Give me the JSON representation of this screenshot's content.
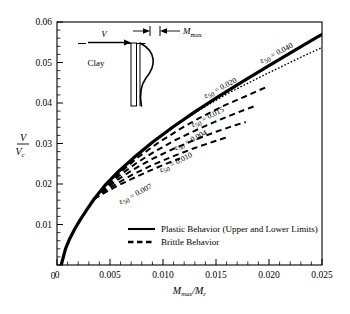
{
  "figure": {
    "background": "#ffffff",
    "plot_frame_color": "#000000"
  },
  "axes": {
    "x": {
      "title_main": "M",
      "title_sub": "max",
      "title_den": "M",
      "title_den_sub": "c",
      "title_full": "Mmax/Mc",
      "min": 0,
      "max": 0.025,
      "major_step": 0.005,
      "minor_step": 0.001,
      "tick_labels": [
        "0",
        "0.005",
        "0.010",
        "0.015",
        "0.020",
        "0.025"
      ],
      "tick_values": [
        0,
        0.005,
        0.01,
        0.015,
        0.02,
        0.025
      ]
    },
    "y": {
      "title_num": "V",
      "title_den": "V",
      "title_den_sub": "c",
      "title_full": "V/Vc",
      "min": 0,
      "max": 0.06,
      "major_step": 0.01,
      "minor_step": 0.002,
      "tick_labels": [
        "0",
        "0.01",
        "0.02",
        "0.03",
        "0.04",
        "0.05",
        "0.06"
      ],
      "tick_values": [
        0,
        0.01,
        0.02,
        0.03,
        0.04,
        0.05,
        0.06
      ]
    }
  },
  "legend": {
    "items": [
      {
        "label": "Plastic Behavior (Upper and Lower Limits)",
        "style": "solid"
      },
      {
        "label": "Brittle Behavior",
        "style": "dashed"
      }
    ]
  },
  "inset": {
    "load_label": "V",
    "soil_label": "Clay",
    "moment_label_main": "M",
    "moment_label_sub": "max"
  },
  "chart_data": {
    "type": "line",
    "title": "",
    "xlabel": "Mmax/Mc",
    "ylabel": "V/Vc",
    "xlim": [
      0,
      0.025
    ],
    "ylim": [
      0,
      0.06
    ],
    "grid": false,
    "legend_position": "bottom-center",
    "series": [
      {
        "name": "Plastic Behavior (Upper and Lower Limits)",
        "style": "solid",
        "width": 3.2,
        "label": "",
        "points": [
          [
            0.0004,
            0.0
          ],
          [
            0.0008,
            0.004
          ],
          [
            0.0012,
            0.0065
          ],
          [
            0.0017,
            0.009
          ],
          [
            0.0022,
            0.0112
          ],
          [
            0.0028,
            0.0136
          ],
          [
            0.0035,
            0.0163
          ],
          [
            0.0045,
            0.0196
          ],
          [
            0.0058,
            0.0231
          ],
          [
            0.0072,
            0.0264
          ],
          [
            0.009,
            0.0303
          ],
          [
            0.011,
            0.0342
          ],
          [
            0.013,
            0.0378
          ],
          [
            0.015,
            0.0412
          ],
          [
            0.0175,
            0.0453
          ],
          [
            0.02,
            0.0492
          ],
          [
            0.0225,
            0.0531
          ],
          [
            0.0245,
            0.0562
          ],
          [
            0.0252,
            0.0572
          ]
        ]
      },
      {
        "name": "eps50 = 0.040",
        "style": "dotted",
        "width": 1.4,
        "label": "ε50 = 0.040",
        "label_value": 0.04,
        "label_x": 0.0193,
        "label_y": 0.0498,
        "label_rotation": -27,
        "points": [
          [
            0.0035,
            0.0163
          ],
          [
            0.0048,
            0.02
          ],
          [
            0.0062,
            0.0238
          ],
          [
            0.008,
            0.0281
          ],
          [
            0.01,
            0.0322
          ],
          [
            0.012,
            0.0359
          ],
          [
            0.0142,
            0.0395
          ],
          [
            0.0165,
            0.0429
          ],
          [
            0.019,
            0.0462
          ],
          [
            0.0215,
            0.0494
          ],
          [
            0.0235,
            0.0519
          ],
          [
            0.025,
            0.0537
          ]
        ]
      },
      {
        "name": "eps50 = 0.020",
        "style": "dashed",
        "width": 2.0,
        "label": "ε50 = 0.020",
        "label_value": 0.02,
        "label_x": 0.014,
        "label_y": 0.0412,
        "label_rotation": -27,
        "points": [
          [
            0.0035,
            0.0163
          ],
          [
            0.0047,
            0.0196
          ],
          [
            0.006,
            0.0229
          ],
          [
            0.0076,
            0.0265
          ],
          [
            0.0095,
            0.0301
          ],
          [
            0.0115,
            0.0334
          ],
          [
            0.0135,
            0.0364
          ],
          [
            0.0158,
            0.0394
          ],
          [
            0.018,
            0.0419
          ],
          [
            0.0198,
            0.044
          ]
        ]
      },
      {
        "name": "eps50 = 0.015",
        "style": "dashed",
        "width": 2.0,
        "label": "ε50 = 0.015",
        "label_value": 0.015,
        "label_x": 0.0128,
        "label_y": 0.034,
        "label_rotation": -27,
        "points": [
          [
            0.0035,
            0.0163
          ],
          [
            0.0046,
            0.0191
          ],
          [
            0.0058,
            0.0219
          ],
          [
            0.0074,
            0.025
          ],
          [
            0.0092,
            0.028
          ],
          [
            0.0112,
            0.0309
          ],
          [
            0.0132,
            0.0334
          ],
          [
            0.0152,
            0.0357
          ],
          [
            0.0172,
            0.0378
          ],
          [
            0.0186,
            0.0392
          ]
        ]
      },
      {
        "name": "eps50 = 0.004",
        "style": "dashed",
        "width": 2.0,
        "label": "ε50 = 0.004",
        "label_value": 0.004,
        "label_x": 0.0112,
        "label_y": 0.0283,
        "label_rotation": -27,
        "points": [
          [
            0.0035,
            0.0163
          ],
          [
            0.0045,
            0.0186
          ],
          [
            0.0057,
            0.021
          ],
          [
            0.0072,
            0.0236
          ],
          [
            0.009,
            0.0262
          ],
          [
            0.011,
            0.0287
          ],
          [
            0.013,
            0.0309
          ],
          [
            0.015,
            0.0329
          ],
          [
            0.0168,
            0.0345
          ],
          [
            0.0178,
            0.0353
          ]
        ]
      },
      {
        "name": "eps50 = 0.010",
        "style": "dashed",
        "width": 2.0,
        "label": "ε50 = 0.010",
        "label_value": 0.01,
        "label_x": 0.0098,
        "label_y": 0.0228,
        "label_rotation": -27,
        "points": [
          [
            0.0035,
            0.0163
          ],
          [
            0.0045,
            0.0182
          ],
          [
            0.0057,
            0.0202
          ],
          [
            0.0072,
            0.0224
          ],
          [
            0.009,
            0.0247
          ],
          [
            0.011,
            0.0269
          ],
          [
            0.013,
            0.0289
          ],
          [
            0.0148,
            0.0305
          ],
          [
            0.0162,
            0.0317
          ]
        ]
      },
      {
        "name": "eps50 = 0.007",
        "style": "dashed",
        "width": 2.0,
        "label": "ε50 = 0.007",
        "label_value": 0.007,
        "label_x": 0.006,
        "label_y": 0.015,
        "label_rotation": -27,
        "points": [
          [
            0.0035,
            0.0163
          ],
          [
            0.0044,
            0.0177
          ],
          [
            0.0056,
            0.0194
          ],
          [
            0.007,
            0.0212
          ],
          [
            0.0086,
            0.0231
          ],
          [
            0.0102,
            0.0249
          ],
          [
            0.0116,
            0.0263
          ]
        ]
      }
    ]
  }
}
